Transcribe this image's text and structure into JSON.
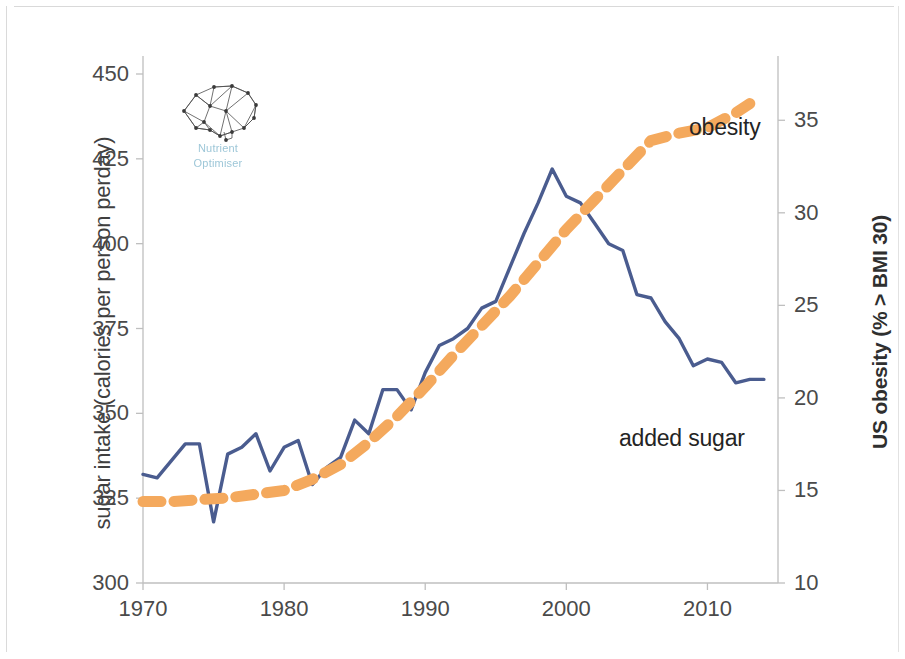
{
  "figure": {
    "left_axis_title": "sugar intake (calories per person perday)",
    "right_axis_title": "US obesity (% > BMI 30)",
    "logo": {
      "name": "Nutrient",
      "subtitle": "Optimiser",
      "mark": "brain-network-icon",
      "color": "#9ec7d8"
    },
    "series_labels": {
      "obesity": "obesity",
      "added_sugar": "added sugar"
    },
    "colors": {
      "added_sugar_line": "#4a5c8f",
      "obesity_line": "#f4a95d",
      "axis_text": "#4a4a4a",
      "axis_line": "#bfbfbf"
    }
  },
  "chart_data": {
    "type": "line",
    "title": "",
    "xlabel": "",
    "ylabel": "sugar intake (calories per person perday)",
    "y2label": "US obesity (% > BMI 30)",
    "xlim": [
      1970,
      2015
    ],
    "ylim": [
      300,
      450
    ],
    "y2lim": [
      10,
      37.5
    ],
    "xticks": [
      1970,
      1980,
      1990,
      2000,
      2010
    ],
    "yticks": [
      300,
      325,
      350,
      375,
      400,
      425,
      450
    ],
    "y2ticks": [
      10,
      15,
      20,
      25,
      30,
      35
    ],
    "grid": false,
    "legend": "inline-annotations",
    "series": [
      {
        "name": "added sugar",
        "axis": "left",
        "style": "solid",
        "color": "#4a5c8f",
        "x": [
          1970,
          1971,
          1972,
          1973,
          1974,
          1975,
          1976,
          1977,
          1978,
          1979,
          1980,
          1981,
          1982,
          1983,
          1984,
          1985,
          1986,
          1987,
          1988,
          1989,
          1990,
          1991,
          1992,
          1993,
          1994,
          1995,
          1996,
          1997,
          1998,
          1999,
          2000,
          2001,
          2002,
          2003,
          2004,
          2005,
          2006,
          2007,
          2008,
          2009,
          2010,
          2011,
          2012,
          2013,
          2014
        ],
        "values": [
          332,
          331,
          336,
          341,
          341,
          318,
          338,
          340,
          344,
          333,
          340,
          342,
          329,
          334,
          337,
          348,
          344,
          357,
          357,
          351,
          362,
          370,
          372,
          375,
          381,
          383,
          393,
          403,
          412,
          422,
          414,
          412,
          406,
          400,
          398,
          385,
          384,
          377,
          372,
          364,
          366,
          365,
          359,
          360,
          360
        ]
      },
      {
        "name": "obesity",
        "axis": "right",
        "style": "dashed",
        "color": "#f4a95d",
        "x": [
          1970,
          1972,
          1974,
          1976,
          1978,
          1980,
          1982,
          1984,
          1986,
          1988,
          1990,
          1992,
          1994,
          1996,
          1998,
          2000,
          2002,
          2004,
          2006,
          2008,
          2010,
          2012,
          2013
        ],
        "values": [
          14.4,
          14.4,
          14.5,
          14.6,
          14.8,
          15.0,
          15.6,
          16.4,
          17.6,
          19.0,
          20.6,
          22.3,
          23.9,
          25.5,
          27.3,
          29.1,
          30.7,
          32.3,
          33.9,
          34.3,
          34.6,
          35.4,
          35.9
        ]
      }
    ]
  }
}
